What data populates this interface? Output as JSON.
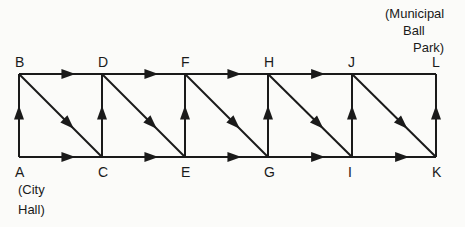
{
  "diagram": {
    "type": "directed-network",
    "nodes": [
      {
        "id": "A",
        "label": "A",
        "row": "bottom",
        "col": 0
      },
      {
        "id": "B",
        "label": "B",
        "row": "top",
        "col": 0
      },
      {
        "id": "C",
        "label": "C",
        "row": "bottom",
        "col": 1
      },
      {
        "id": "D",
        "label": "D",
        "row": "top",
        "col": 1
      },
      {
        "id": "E",
        "label": "E",
        "row": "bottom",
        "col": 2
      },
      {
        "id": "F",
        "label": "F",
        "row": "top",
        "col": 2
      },
      {
        "id": "G",
        "label": "G",
        "row": "bottom",
        "col": 3
      },
      {
        "id": "H",
        "label": "H",
        "row": "top",
        "col": 3
      },
      {
        "id": "I",
        "label": "I",
        "row": "bottom",
        "col": 4
      },
      {
        "id": "J",
        "label": "J",
        "row": "top",
        "col": 4
      },
      {
        "id": "K",
        "label": "K",
        "row": "bottom",
        "col": 5
      },
      {
        "id": "L",
        "label": "L",
        "row": "top",
        "col": 5
      }
    ],
    "edges": [
      {
        "from": "A",
        "to": "B"
      },
      {
        "from": "A",
        "to": "C"
      },
      {
        "from": "B",
        "to": "D"
      },
      {
        "from": "B",
        "to": "C"
      },
      {
        "from": "C",
        "to": "D"
      },
      {
        "from": "C",
        "to": "E"
      },
      {
        "from": "D",
        "to": "F"
      },
      {
        "from": "D",
        "to": "E"
      },
      {
        "from": "E",
        "to": "F"
      },
      {
        "from": "E",
        "to": "G"
      },
      {
        "from": "F",
        "to": "H"
      },
      {
        "from": "F",
        "to": "G"
      },
      {
        "from": "G",
        "to": "H"
      },
      {
        "from": "G",
        "to": "I"
      },
      {
        "from": "H",
        "to": "J"
      },
      {
        "from": "H",
        "to": "I"
      },
      {
        "from": "I",
        "to": "J"
      },
      {
        "from": "I",
        "to": "K"
      },
      {
        "from": "J",
        "to": "I",
        "note": "none"
      },
      {
        "from": "J",
        "to": "K"
      },
      {
        "from": "J",
        "to": "L",
        "arrow": false
      },
      {
        "from": "K",
        "to": "L"
      }
    ],
    "annotations": {
      "start": {
        "node": "A",
        "lines": [
          "(City",
          "Hall)"
        ]
      },
      "end": {
        "node": "L",
        "lines": [
          "(Municipal",
          "Ball",
          "Park)"
        ]
      }
    }
  }
}
